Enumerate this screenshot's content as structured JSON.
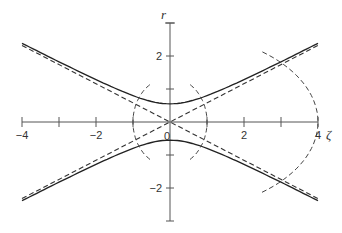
{
  "diagram": {
    "x_axis": {
      "label": "ζ",
      "range": [
        -4,
        4
      ],
      "ticks": [
        -4,
        -3,
        -2,
        -1,
        1,
        2,
        3,
        4
      ],
      "tick_labels": [
        {
          "value": -4,
          "text": "−4"
        },
        {
          "value": -2,
          "text": "−2"
        },
        {
          "value": 2,
          "text": "2"
        },
        {
          "value": 4,
          "text": "4"
        }
      ]
    },
    "y_axis": {
      "label": "r",
      "range": [
        -3,
        3
      ],
      "ticks": [
        -3,
        -2,
        -1,
        1,
        2,
        3
      ],
      "tick_labels": [
        {
          "value": 2,
          "text": "2"
        },
        {
          "value": -2,
          "text": "−2"
        }
      ]
    },
    "origin_label": "0",
    "hyperbola": {
      "a": 0.55,
      "slope": 0.58,
      "style": "solid"
    },
    "asymptotes": {
      "slope": 0.58,
      "style": "dashed"
    },
    "arcs": [
      {
        "name": "inner-left",
        "center_zeta": 0,
        "cross_zeta": -1,
        "style": "dashed"
      },
      {
        "name": "inner-right",
        "center_zeta": 0,
        "cross_zeta": 1,
        "style": "dashed"
      },
      {
        "name": "outer-right",
        "center_zeta": 0,
        "cross_zeta": 4,
        "style": "dashed"
      }
    ]
  }
}
